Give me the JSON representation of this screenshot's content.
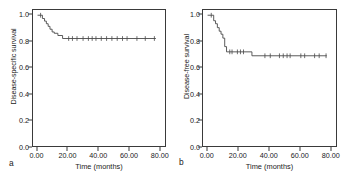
{
  "figure": {
    "background": "#ffffff",
    "line_color": "#4a4a4a",
    "axis_color": "#3a3a3a"
  },
  "panels": [
    {
      "letter": "a",
      "ylabel": "Disease-specific survival",
      "xlabel": "Time (months)"
    },
    {
      "letter": "b",
      "ylabel": "Disease-free survival",
      "xlabel": "Time (months)"
    }
  ],
  "chart_data": [
    {
      "type": "line",
      "plot_kind": "kaplan-meier-step",
      "panel": "a",
      "title": "",
      "xlabel": "Time (months)",
      "ylabel": "Disease-specific survival",
      "xlim": [
        -3,
        84
      ],
      "ylim": [
        0.0,
        1.04
      ],
      "xticks": [
        "0.00",
        "20.00",
        "40.00",
        "60.00",
        "80.00"
      ],
      "xtick_values": [
        0,
        20,
        40,
        60,
        80
      ],
      "yticks": [
        "0.0",
        "0.2",
        "0.4",
        "0.6",
        "0.8",
        "1.0"
      ],
      "ytick_values": [
        0.0,
        0.2,
        0.4,
        0.6,
        0.8,
        1.0
      ],
      "grid": false,
      "legend": "none",
      "series": [
        {
          "name": "Disease-specific survival",
          "steps": [
            [
              0.0,
              1.0
            ],
            [
              3.2,
              1.0
            ],
            [
              3.2,
              0.975
            ],
            [
              4.6,
              0.975
            ],
            [
              4.6,
              0.955
            ],
            [
              5.8,
              0.955
            ],
            [
              5.8,
              0.935
            ],
            [
              7.0,
              0.935
            ],
            [
              7.0,
              0.915
            ],
            [
              8.2,
              0.915
            ],
            [
              8.2,
              0.893
            ],
            [
              9.6,
              0.893
            ],
            [
              9.6,
              0.872
            ],
            [
              11.0,
              0.872
            ],
            [
              11.0,
              0.862
            ],
            [
              13.4,
              0.862
            ],
            [
              13.4,
              0.845
            ],
            [
              16.5,
              0.845
            ],
            [
              16.5,
              0.822
            ],
            [
              78.0,
              0.822
            ]
          ],
          "censored": [
            [
              2.0,
              1.0
            ],
            [
              20.5,
              0.822
            ],
            [
              23.0,
              0.822
            ],
            [
              26.0,
              0.822
            ],
            [
              30.0,
              0.822
            ],
            [
              33.5,
              0.822
            ],
            [
              36.0,
              0.822
            ],
            [
              38.5,
              0.822
            ],
            [
              42.0,
              0.822
            ],
            [
              45.5,
              0.822
            ],
            [
              49.0,
              0.822
            ],
            [
              52.5,
              0.822
            ],
            [
              56.0,
              0.822
            ],
            [
              59.0,
              0.822
            ],
            [
              65.5,
              0.822
            ],
            [
              71.0,
              0.822
            ],
            [
              77.0,
              0.822
            ]
          ],
          "plateau_value": 0.82,
          "max_followup_months": 78.0
        }
      ]
    },
    {
      "type": "line",
      "plot_kind": "kaplan-meier-step",
      "panel": "b",
      "title": "",
      "xlabel": "Time (months)",
      "ylabel": "Disease-free survival",
      "xlim": [
        -3,
        84
      ],
      "ylim": [
        0.0,
        1.04
      ],
      "xticks": [
        "0.00",
        "20.00",
        "40.00",
        "60.00",
        "80.00"
      ],
      "xtick_values": [
        0,
        20,
        40,
        60,
        80
      ],
      "yticks": [
        "0.0",
        "0.2",
        "0.4",
        "0.6",
        "0.8",
        "1.0"
      ],
      "ytick_values": [
        0.0,
        0.2,
        0.4,
        0.6,
        0.8,
        1.0
      ],
      "grid": false,
      "legend": "none",
      "series": [
        {
          "name": "Disease-free survival",
          "steps": [
            [
              0.0,
              1.0
            ],
            [
              4.0,
              1.0
            ],
            [
              4.0,
              0.958
            ],
            [
              5.2,
              0.958
            ],
            [
              5.2,
              0.935
            ],
            [
              6.4,
              0.935
            ],
            [
              6.4,
              0.905
            ],
            [
              7.6,
              0.905
            ],
            [
              7.6,
              0.878
            ],
            [
              8.8,
              0.878
            ],
            [
              8.8,
              0.855
            ],
            [
              10.0,
              0.855
            ],
            [
              10.0,
              0.825
            ],
            [
              11.2,
              0.825
            ],
            [
              11.2,
              0.76
            ],
            [
              12.4,
              0.76
            ],
            [
              12.4,
              0.72
            ],
            [
              29.0,
              0.72
            ],
            [
              29.0,
              0.69
            ],
            [
              78.0,
              0.69
            ]
          ],
          "censored": [
            [
              2.4,
              1.0
            ],
            [
              14.5,
              0.72
            ],
            [
              16.0,
              0.72
            ],
            [
              19.5,
              0.72
            ],
            [
              21.5,
              0.72
            ],
            [
              23.5,
              0.72
            ],
            [
              37.5,
              0.69
            ],
            [
              41.0,
              0.69
            ],
            [
              47.0,
              0.69
            ],
            [
              49.5,
              0.69
            ],
            [
              52.0,
              0.69
            ],
            [
              54.0,
              0.69
            ],
            [
              61.0,
              0.69
            ],
            [
              63.5,
              0.69
            ],
            [
              70.0,
              0.69
            ],
            [
              73.0,
              0.69
            ],
            [
              77.5,
              0.69
            ]
          ],
          "plateau_value_early": 0.72,
          "plateau_value_late": 0.69,
          "max_followup_months": 78.0
        }
      ]
    }
  ]
}
